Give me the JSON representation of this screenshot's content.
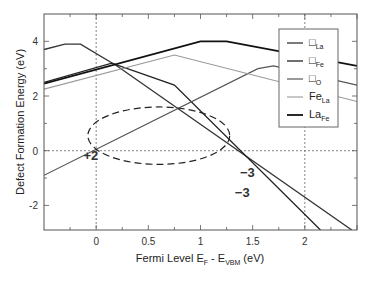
{
  "chart_data": {
    "type": "line",
    "title": "",
    "xlabel": "Fermi Level E_F - E_VBM (eV)",
    "xlabel_parts": {
      "main": "Fermi Level E",
      "sub1": "F",
      "mid": " - E",
      "sub2": "VBM",
      "end": " (eV)"
    },
    "ylabel": "Defect Formation Energy (eV)",
    "xlim": [
      -0.5,
      2.5
    ],
    "ylim": [
      -2.9,
      5.0
    ],
    "x_ticks": [
      "0",
      "0.5",
      "1",
      "1.5",
      "2"
    ],
    "y_ticks": [
      "4",
      "2",
      "0",
      "-2"
    ],
    "grid": false,
    "reference_lines": {
      "x": [
        0,
        2
      ],
      "y": [
        0
      ]
    },
    "legend_position": "upper right",
    "series": [
      {
        "name": "V_La",
        "label": "□",
        "sub": "La",
        "color": "#333333",
        "width": 1.3,
        "points": [
          [
            -0.5,
            3.7
          ],
          [
            -0.3,
            3.9
          ],
          [
            -0.15,
            3.9
          ],
          [
            0.2,
            3.1
          ],
          [
            2.45,
            -2.9
          ]
        ]
      },
      {
        "name": "V_Fe",
        "label": "□",
        "sub": "Fe",
        "color": "#222222",
        "width": 1.3,
        "points": [
          [
            -0.5,
            2.5
          ],
          [
            0.15,
            3.2
          ],
          [
            0.75,
            2.4
          ],
          [
            2.15,
            -2.9
          ]
        ]
      },
      {
        "name": "V_O",
        "label": "□",
        "sub": "O",
        "color": "#555555",
        "width": 1.2,
        "points": [
          [
            -0.5,
            -0.9
          ],
          [
            1.55,
            3.0
          ],
          [
            1.7,
            3.1
          ],
          [
            2.5,
            2.4
          ]
        ]
      },
      {
        "name": "Fe_La",
        "label": "Fe",
        "sub": "La",
        "color": "#999999",
        "width": 1.1,
        "points": [
          [
            -0.5,
            2.25
          ],
          [
            0.75,
            3.5
          ],
          [
            2.5,
            1.8
          ]
        ]
      },
      {
        "name": "La_Fe",
        "label": "La",
        "sub": "Fe",
        "color": "#111111",
        "width": 1.8,
        "points": [
          [
            -0.5,
            2.45
          ],
          [
            1.0,
            4.0
          ],
          [
            1.25,
            4.0
          ],
          [
            2.5,
            3.1
          ]
        ]
      }
    ],
    "annotations": [
      {
        "text": "+2",
        "x": -0.05,
        "y": -0.35
      },
      {
        "text": "−3",
        "x": 1.45,
        "y": -0.95
      },
      {
        "text": "−3",
        "x": 1.4,
        "y": -1.7
      }
    ],
    "ellipse": {
      "cx": 0.6,
      "cy": 0.55,
      "rx": 0.68,
      "ry": 1.05,
      "style": "dashed"
    }
  }
}
